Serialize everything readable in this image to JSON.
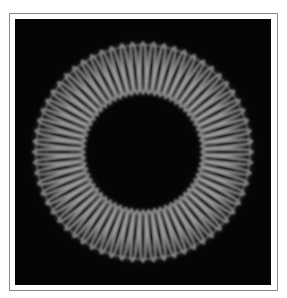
{
  "image": {
    "description": "Dark square with a glowing ring of radial petal/spoke pattern",
    "background_color": "#050505",
    "frame_color": "#8a8a8a",
    "ring": {
      "center": [
        128,
        133
      ],
      "inner_radius": 58,
      "outer_radius": 110,
      "spoke_count": 64,
      "glow_color": "#cfcfcf"
    }
  }
}
